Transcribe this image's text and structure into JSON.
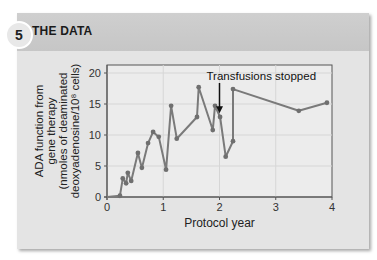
{
  "header": {
    "badge_number": "5",
    "title": "THE DATA"
  },
  "chart_data": {
    "type": "line",
    "title": "",
    "xlabel": "Protocol year",
    "ylabel_lines": [
      "ADA function from",
      "gene therapy",
      "(nmoles of deaminated",
      "deoxyadenosine/10⁸ cells)"
    ],
    "xlim": [
      0,
      4
    ],
    "ylim": [
      0,
      20
    ],
    "xticks": [
      0,
      1,
      2,
      3,
      4
    ],
    "yticks": [
      0,
      5,
      10,
      15,
      20
    ],
    "grid": true,
    "legend": null,
    "series": [
      {
        "name": "ADA function",
        "color": "#7a7a7a",
        "x": [
          0,
          0.23,
          0.28,
          0.34,
          0.37,
          0.43,
          0.55,
          0.62,
          0.73,
          0.82,
          0.92,
          1.05,
          1.14,
          1.24,
          1.6,
          1.63,
          1.88,
          1.92,
          2.01,
          2.11,
          2.24,
          2.24,
          3.41,
          3.91
        ],
        "y": [
          0,
          0.2,
          3.0,
          2.2,
          3.9,
          2.6,
          7.1,
          4.7,
          8.7,
          10.5,
          9.7,
          4.4,
          14.7,
          9.4,
          12.9,
          17.7,
          10.8,
          14.7,
          12.9,
          6.5,
          9.0,
          17.4,
          13.9,
          15.2
        ]
      }
    ],
    "annotations": [
      {
        "text": "Transfusions stopped",
        "arrow_x": 2.0,
        "arrow_y_from": 19.0,
        "arrow_y_to": 13.5
      }
    ]
  }
}
